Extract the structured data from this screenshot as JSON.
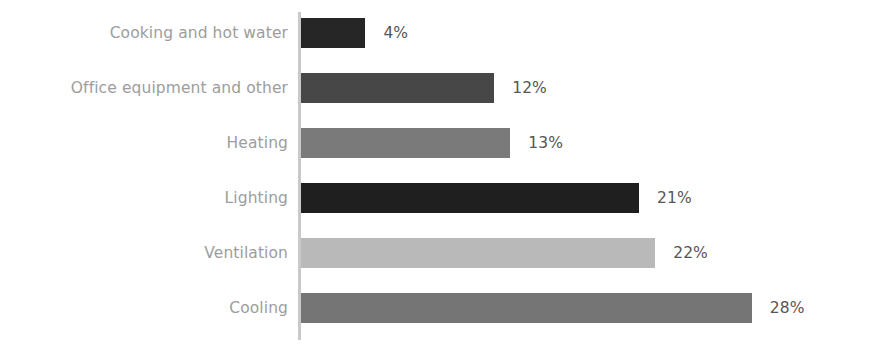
{
  "chart_data": {
    "type": "bar",
    "orientation": "horizontal",
    "title": "",
    "subtitle": "",
    "xlabel": "",
    "ylabel": "",
    "xlim": [
      0,
      28
    ],
    "grid": false,
    "legend": null,
    "value_suffix": "%",
    "categories": [
      "Cooking and hot water",
      "Office equipment and other",
      "Heating",
      "Lighting",
      "Ventilation",
      "Cooling"
    ],
    "values": [
      4,
      12,
      13,
      21,
      22,
      28
    ],
    "value_labels": [
      "4%",
      "12%",
      "13%",
      "21%",
      "22%",
      "28%"
    ],
    "bar_colors": [
      "#262626",
      "#474747",
      "#7a7a7a",
      "#1f1f1f",
      "#b9b9b9",
      "#757575"
    ],
    "bars": [
      {
        "label": "Cooking and hot water",
        "value": 4,
        "value_label": "4%",
        "color": "#262626"
      },
      {
        "label": "Office equipment and other",
        "value": 12,
        "value_label": "12%",
        "color": "#474747"
      },
      {
        "label": "Heating",
        "value": 13,
        "value_label": "13%",
        "color": "#7a7a7a"
      },
      {
        "label": "Lighting",
        "value": 21,
        "value_label": "21%",
        "color": "#1f1f1f"
      },
      {
        "label": "Ventilation",
        "value": 22,
        "value_label": "22%",
        "color": "#b9b9b9"
      },
      {
        "label": "Cooling",
        "value": 28,
        "value_label": "28%",
        "color": "#757575"
      }
    ]
  },
  "style": {
    "background": "#ffffff",
    "axis_color": "#c9c9c9",
    "category_label_color": "#9d9d9d",
    "value_label_color": "#565656"
  },
  "layout": {
    "axis_x": 301,
    "first_row_top": 18,
    "row_pitch": 55,
    "bar_height": 30,
    "px_per_unit": 16.1,
    "value_label_gap": 18
  }
}
